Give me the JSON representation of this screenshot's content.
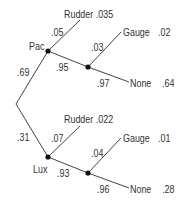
{
  "tree": {
    "root": {
      "branch_up": ".69",
      "branch_down": ".31"
    },
    "pac": {
      "label": "Pac",
      "rudder_prob": ".05",
      "rudder_label": "Rudder .035",
      "continue_prob": ".95",
      "gauge_prob": ".03",
      "gauge_label": "Gauge",
      "gauge_value": ".02",
      "none_prob": ".97",
      "none_label": "None",
      "none_value": ".64"
    },
    "lux": {
      "label": "Lux",
      "rudder_prob": ".07",
      "rudder_label": "Rudder .022",
      "continue_prob": ".93",
      "gauge_prob": ".04",
      "gauge_label": "Gauge",
      "gauge_value": ".01",
      "none_prob": ".96",
      "none_label": "None",
      "none_value": ".28"
    }
  }
}
